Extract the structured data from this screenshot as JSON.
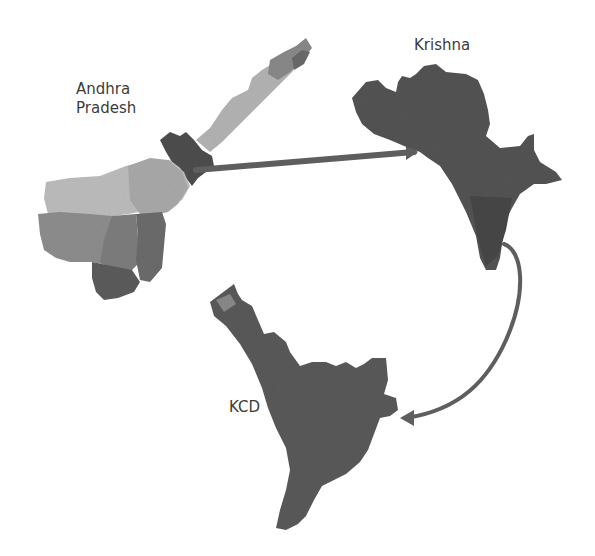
{
  "figure": {
    "labels": {
      "state": [
        "Andhra",
        "Pradesh"
      ],
      "district": "Krishna",
      "delta": "KCD"
    },
    "colors": {
      "background": "#ffffff",
      "label_text": "#3c3c3c",
      "ap_light": "#b4b4b4",
      "ap_mid": "#9a9a9a",
      "ap_dark": "#7c7c7c",
      "ap_darker": "#606060",
      "krishna_fill": "#545454",
      "kcd_fill": "#5a5a5a",
      "arrow": "#5e5e5e"
    },
    "arrows": [
      {
        "from": "Krishna district in Andhra Pradesh",
        "to": "Krishna"
      },
      {
        "from": "Krishna",
        "to": "KCD"
      }
    ]
  }
}
